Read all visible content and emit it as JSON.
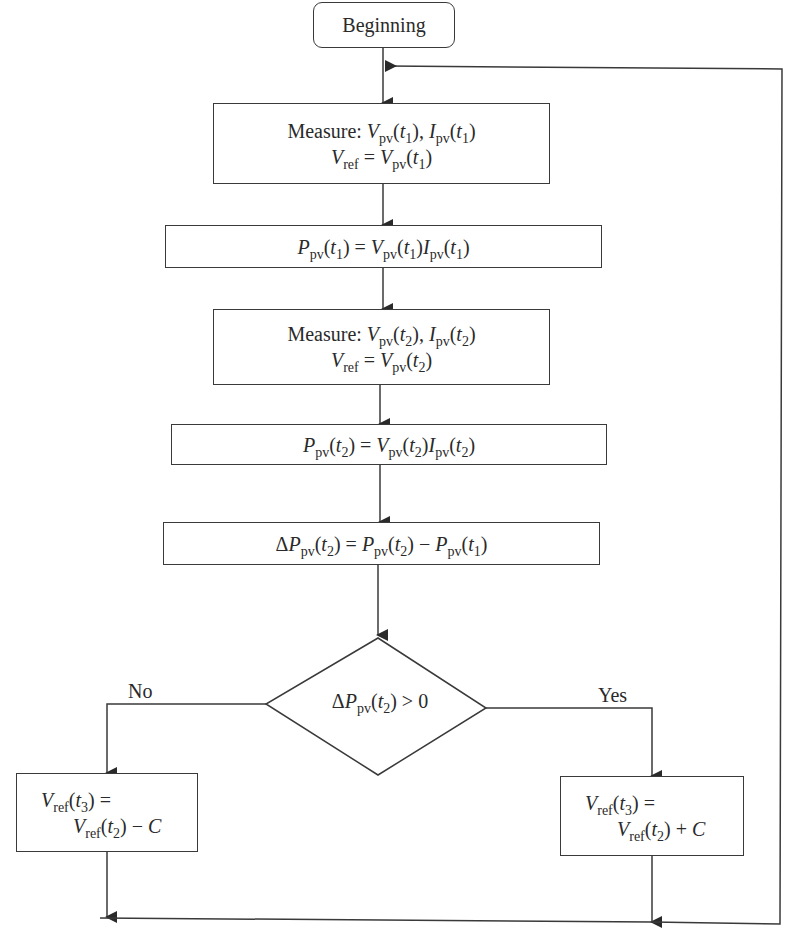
{
  "diagram": {
    "colors": {
      "stroke": "#3a3a3a",
      "text": "#2a2a2a",
      "background": "#ffffff"
    },
    "nodes": [
      {
        "id": "start",
        "type": "terminal",
        "text": "Beginning"
      },
      {
        "id": "measure1",
        "type": "process",
        "lines": [
          "Measure: Vpv(t1), Ipv(t1)",
          "Vref = Vpv(t1)"
        ]
      },
      {
        "id": "power1",
        "type": "process",
        "text": "Ppv(t1) = Vpv(t1)Ipv(t1)"
      },
      {
        "id": "measure2",
        "type": "process",
        "lines": [
          "Measure: Vpv(t2), Ipv(t2)",
          "Vref = Vpv(t2)"
        ]
      },
      {
        "id": "power2",
        "type": "process",
        "text": "Ppv(t2) = Vpv(t2)Ipv(t2)"
      },
      {
        "id": "delta",
        "type": "process",
        "text": "ΔPpv(t2) = Ppv(t2) − Ppv(t1)"
      },
      {
        "id": "decision",
        "type": "decision",
        "text": "ΔPpv(t2) > 0"
      },
      {
        "id": "decrease",
        "type": "process",
        "lines": [
          "Vref(t3) =",
          "Vref(t2) − C"
        ]
      },
      {
        "id": "increase",
        "type": "process",
        "lines": [
          "Vref(t3) =",
          "Vref(t2) + C"
        ]
      }
    ],
    "edges": [
      {
        "from": "start",
        "to": "measure1"
      },
      {
        "from": "measure1",
        "to": "power1"
      },
      {
        "from": "power1",
        "to": "measure2"
      },
      {
        "from": "measure2",
        "to": "power2"
      },
      {
        "from": "power2",
        "to": "delta"
      },
      {
        "from": "delta",
        "to": "decision"
      },
      {
        "from": "decision",
        "to": "decrease",
        "label": "No"
      },
      {
        "from": "decision",
        "to": "increase",
        "label": "Yes"
      },
      {
        "from": "decrease",
        "to": "measure1",
        "note": "loop back"
      },
      {
        "from": "increase",
        "to": "measure1",
        "note": "loop back"
      }
    ],
    "labels": {
      "no": "No",
      "yes": "Yes"
    },
    "text": {
      "beginning": "Beginning",
      "measure": "Measure:",
      "eq": "=",
      "minus": "−",
      "plus": "+",
      "gt": ">",
      "zero": "0",
      "comma": ",",
      "V": "V",
      "I": "I",
      "P": "P",
      "C": "C",
      "delta": "Δ",
      "pv": "pv",
      "ref": "ref",
      "t1": "(t",
      "close": ")"
    }
  }
}
